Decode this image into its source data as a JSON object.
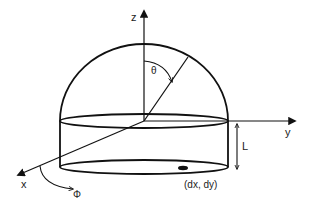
{
  "diagram": {
    "type": "hemispherical dome on cylinder with coordinate axes",
    "labels": {
      "z_axis": "z",
      "y_axis": "y",
      "x_axis": "x",
      "theta": "θ",
      "phi": "Φ",
      "height": "L",
      "point": "(dx, dy)"
    },
    "colors": {
      "stroke": "#111111",
      "background": "#ffffff"
    }
  }
}
